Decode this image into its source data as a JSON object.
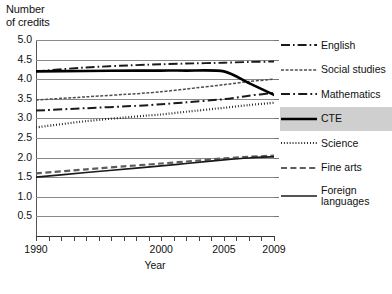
{
  "axes": {
    "y_title": "Number\nof credits",
    "x_title": "Year",
    "y_ticks": [
      "5.0",
      "4.5",
      "4.0",
      "3.5",
      "3.0",
      "2.5",
      "2.0",
      "1.5",
      "1.0",
      "0.5"
    ],
    "x_labels": [
      "1990",
      "2000",
      "2005",
      "2009"
    ]
  },
  "legend": {
    "items": [
      {
        "label": "English",
        "style": "long-dash-dot",
        "highlight": false
      },
      {
        "label": "Social studies",
        "style": "fine-dash",
        "highlight": false
      },
      {
        "label": "Mathematics",
        "style": "dash-dot",
        "highlight": false
      },
      {
        "label": "CTE",
        "style": "solid-thick",
        "highlight": true
      },
      {
        "label": "Science",
        "style": "dotted",
        "highlight": false
      },
      {
        "label": "Fine arts",
        "style": "med-dash",
        "highlight": false
      },
      {
        "label": "Foreign\nlanguages",
        "style": "solid-thin",
        "highlight": false
      }
    ]
  },
  "chart_data": {
    "type": "line",
    "title": "",
    "xlabel": "Year",
    "ylabel": "Number of credits",
    "xlim": [
      1990,
      2009
    ],
    "ylim": [
      0.0,
      5.0
    ],
    "ytick_values": [
      0.5,
      1.0,
      1.5,
      2.0,
      2.5,
      3.0,
      3.5,
      4.0,
      4.5,
      5.0
    ],
    "xtick_values": [
      1990,
      1991,
      1992,
      1993,
      1994,
      1995,
      1996,
      1997,
      1998,
      1999,
      2000,
      2001,
      2002,
      2003,
      2004,
      2005,
      2006,
      2007,
      2008,
      2009
    ],
    "xtick_labeled": [
      1990,
      2000,
      2005,
      2009
    ],
    "grid": "horizontal",
    "legend_position": "right",
    "x": [
      1990,
      1994,
      1998,
      2000,
      2002,
      2005,
      2007,
      2009
    ],
    "series": [
      {
        "name": "English",
        "style": "long-dash-dot",
        "values": [
          4.2,
          4.3,
          4.36,
          4.38,
          4.4,
          4.42,
          4.44,
          4.45
        ]
      },
      {
        "name": "Social studies",
        "style": "fine-dash",
        "values": [
          3.47,
          3.55,
          3.63,
          3.68,
          3.75,
          3.86,
          3.94,
          4.0
        ]
      },
      {
        "name": "Mathematics",
        "style": "dash-dot",
        "values": [
          3.2,
          3.26,
          3.32,
          3.36,
          3.41,
          3.49,
          3.58,
          3.65
        ]
      },
      {
        "name": "CTE",
        "style": "solid-thick",
        "values": [
          4.2,
          4.21,
          4.22,
          4.22,
          4.22,
          4.2,
          3.9,
          3.6
        ]
      },
      {
        "name": "Science",
        "style": "dotted",
        "values": [
          2.77,
          2.93,
          3.05,
          3.1,
          3.17,
          3.27,
          3.34,
          3.4
        ]
      },
      {
        "name": "Fine arts",
        "style": "med-dash",
        "values": [
          1.6,
          1.7,
          1.8,
          1.85,
          1.9,
          1.98,
          2.02,
          2.05
        ]
      },
      {
        "name": "Foreign languages",
        "style": "solid-thin",
        "values": [
          1.5,
          1.62,
          1.73,
          1.79,
          1.85,
          1.94,
          1.99,
          2.02
        ]
      }
    ]
  }
}
